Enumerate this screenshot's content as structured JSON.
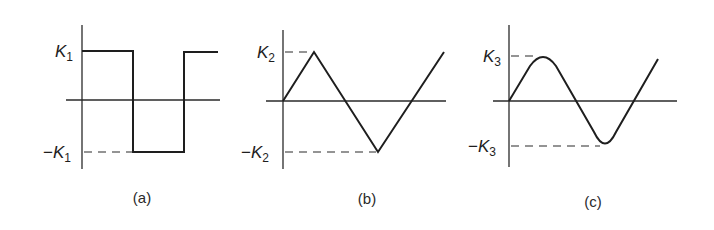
{
  "panels": [
    {
      "id": "a",
      "caption": "(a)",
      "shape": "square wave",
      "pos_label": {
        "symbol": "K",
        "sub": "1",
        "sign": ""
      },
      "neg_label": {
        "symbol": "K",
        "sub": "1",
        "sign": "−"
      }
    },
    {
      "id": "b",
      "caption": "(b)",
      "shape": "triangle wave",
      "pos_label": {
        "symbol": "K",
        "sub": "2",
        "sign": ""
      },
      "neg_label": {
        "symbol": "K",
        "sub": "2",
        "sign": "−"
      }
    },
    {
      "id": "c",
      "caption": "(c)",
      "shape": "rounded (sine-like) wave",
      "pos_label": {
        "symbol": "K",
        "sub": "3",
        "sign": ""
      },
      "neg_label": {
        "symbol": "K",
        "sub": "3",
        "sign": "−"
      }
    }
  ],
  "colors": {
    "ink": "#1e1e1e",
    "background": "#ffffff"
  }
}
